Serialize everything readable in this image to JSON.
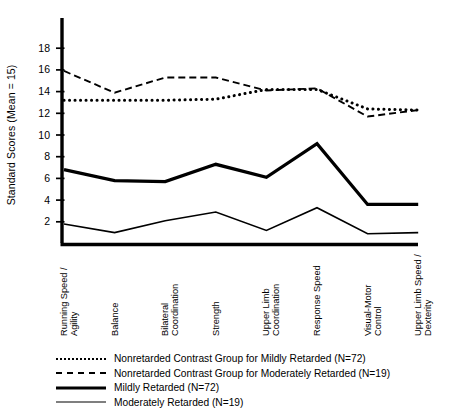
{
  "chart_data": {
    "type": "line",
    "title": "",
    "xlabel": "",
    "ylabel": "Standard Scores (Mean = 15)",
    "ylim": [
      0,
      19.5
    ],
    "yticks": [
      2,
      4,
      6,
      8,
      10,
      12,
      14,
      16,
      18
    ],
    "grid": false,
    "legend_position": "below",
    "categories": [
      "Running Speed / Agility",
      "Balance",
      "Bilateral Coordination",
      "Strength",
      "Upper Limb Coordination",
      "Response Speed",
      "Visual-Motor Control",
      "Upper Limb Speed / Dexterity"
    ],
    "series": [
      {
        "name": "Nonretarded Contrast Group for Mildly Retarded (N=72)",
        "style": "dotted",
        "values": [
          13.2,
          13.2,
          13.2,
          13.3,
          14.2,
          14.2,
          12.4,
          12.3
        ]
      },
      {
        "name": "Nonretarded Contrast Group for Moderately Retarded (N=19)",
        "style": "dashed",
        "values": [
          15.9,
          13.9,
          15.3,
          15.3,
          14.1,
          14.3,
          11.7,
          12.3
        ]
      },
      {
        "name": "Mildly Retarded (N=72)",
        "style": "thick-solid",
        "values": [
          6.8,
          5.8,
          5.7,
          7.3,
          6.1,
          9.2,
          3.6,
          3.6
        ]
      },
      {
        "name": "Moderately Retarded (N=19)",
        "style": "thin-solid",
        "values": [
          1.8,
          1.0,
          2.1,
          2.9,
          1.2,
          3.3,
          0.9,
          1.0
        ]
      }
    ]
  },
  "axis": {
    "y_title": "Standard Scores (Mean = 15)",
    "y_tick_labels": [
      "18",
      "16",
      "14",
      "12",
      "10",
      "8",
      "6",
      "4",
      "2"
    ],
    "x_tick_labels": [
      [
        "Running Speed /",
        "Agility"
      ],
      [
        "Balance"
      ],
      [
        "Bilateral",
        "Coordination"
      ],
      [
        "Strength"
      ],
      [
        "Upper Limb",
        "Coordination"
      ],
      [
        "Response Speed"
      ],
      [
        "Visual-Motor",
        "Control"
      ],
      [
        "Upper Limb Speed /",
        "Dexterity"
      ]
    ]
  },
  "legend": {
    "items": [
      {
        "icon": "dotted-line-icon",
        "label": "Nonretarded Contrast Group for Mildly Retarded (N=72)"
      },
      {
        "icon": "dashed-line-icon",
        "label": "Nonretarded Contrast Group for Moderately Retarded (N=19)"
      },
      {
        "icon": "thick-solid-line-icon",
        "label": "Mildly Retarded (N=72)"
      },
      {
        "icon": "thin-solid-line-icon",
        "label": "Moderately Retarded (N=19)"
      }
    ]
  },
  "colors": {
    "ink": "#000000",
    "background": "#ffffff"
  }
}
